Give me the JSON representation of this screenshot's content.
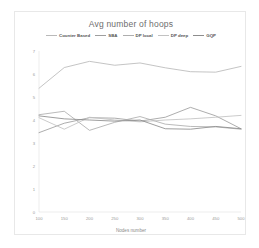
{
  "chart_data": {
    "type": "line",
    "title": "Avg number of hoops",
    "xlabel": "Nodes number",
    "ylabel": "",
    "x": [
      100,
      150,
      200,
      250,
      300,
      350,
      400,
      450,
      500
    ],
    "xtick_labels": [
      "100",
      "150",
      "200",
      "250",
      "300",
      "350",
      "400",
      "450",
      "500"
    ],
    "ytick_labels": [
      "0",
      "1",
      "2",
      "3",
      "4",
      "5",
      "6",
      "7"
    ],
    "ylim": [
      0,
      7
    ],
    "xlim": [
      100,
      500
    ],
    "grid": false,
    "legend_position": "top-center",
    "series": [
      {
        "name": "Counter Based",
        "color": "#b9b9b9",
        "values": [
          5.38,
          6.28,
          6.55,
          6.38,
          6.48,
          6.27,
          6.1,
          6.08,
          6.33
        ]
      },
      {
        "name": "SBA",
        "color": "#9e9e9e",
        "values": [
          3.45,
          3.86,
          4.1,
          4.08,
          3.95,
          4.12,
          4.55,
          4.18,
          3.62
        ]
      },
      {
        "name": "DP local",
        "color": "#aeaeae",
        "values": [
          4.23,
          4.38,
          3.55,
          3.9,
          4.15,
          3.82,
          3.72,
          3.7,
          3.6
        ]
      },
      {
        "name": "DP deep",
        "color": "#c2c2c2",
        "values": [
          4.1,
          3.6,
          4.12,
          4.0,
          3.92,
          4.0,
          4.05,
          4.12,
          4.2
        ]
      },
      {
        "name": "GQP",
        "color": "#8d8d8d",
        "values": [
          4.18,
          4.05,
          4.0,
          3.95,
          4.0,
          3.62,
          3.6,
          3.72,
          3.62
        ]
      }
    ]
  }
}
